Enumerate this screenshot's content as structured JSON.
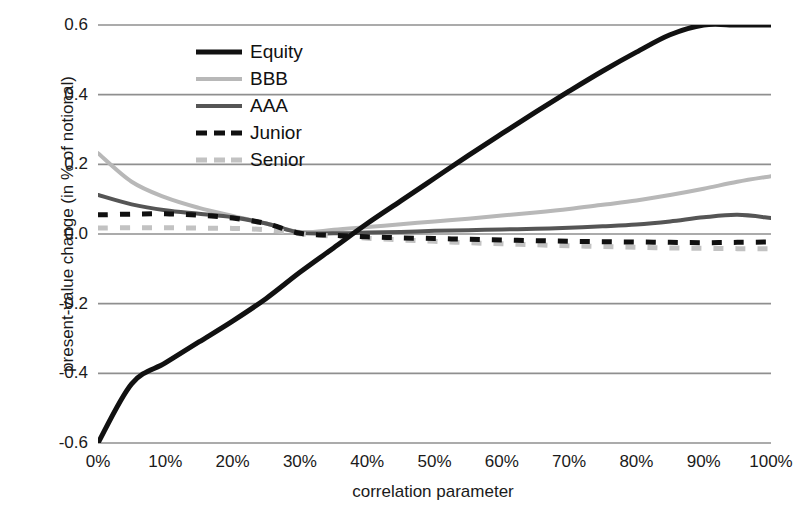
{
  "chart_data": {
    "type": "line",
    "title": "",
    "xlabel": "correlation parameter",
    "ylabel": "present-value change (in % of notional)",
    "xlim": [
      0,
      100
    ],
    "ylim": [
      -0.6,
      0.6
    ],
    "grid": true,
    "legend_position": "upper-left-inside",
    "x_ticklabels": [
      "0%",
      "10%",
      "20%",
      "30%",
      "40%",
      "50%",
      "60%",
      "70%",
      "80%",
      "90%",
      "100%"
    ],
    "x_tickvalues": [
      0,
      10,
      20,
      30,
      40,
      50,
      60,
      70,
      80,
      90,
      100
    ],
    "y_ticklabels": [
      "0.6",
      "0.4",
      "0.2",
      "0.0",
      "-0.2",
      "-0.4",
      "-0.6"
    ],
    "y_tickvalues": [
      0.6,
      0.4,
      0.2,
      0.0,
      -0.2,
      -0.4,
      -0.6
    ],
    "x": [
      0,
      5,
      10,
      15,
      20,
      25,
      30,
      35,
      40,
      45,
      50,
      55,
      60,
      65,
      70,
      75,
      80,
      85,
      90,
      95,
      100
    ],
    "series": [
      {
        "name": "Equity",
        "style": "solid",
        "color": "#111111",
        "width": 5,
        "clipped_above": 0.6,
        "values": [
          -0.6,
          -0.43,
          -0.37,
          -0.31,
          -0.25,
          -0.185,
          -0.11,
          -0.04,
          0.03,
          0.095,
          0.16,
          0.225,
          0.288,
          0.35,
          0.41,
          0.468,
          0.522,
          0.572,
          0.6,
          0.6,
          0.6
        ]
      },
      {
        "name": "BBB",
        "style": "solid",
        "color": "#b8b8b8",
        "width": 4,
        "values": [
          0.232,
          0.15,
          0.105,
          0.075,
          0.052,
          0.03,
          0.006,
          0.012,
          0.02,
          0.028,
          0.036,
          0.044,
          0.053,
          0.062,
          0.072,
          0.084,
          0.096,
          0.112,
          0.13,
          0.15,
          0.166
        ]
      },
      {
        "name": "AAA",
        "style": "solid",
        "color": "#555555",
        "width": 4,
        "values": [
          0.112,
          0.085,
          0.068,
          0.058,
          0.048,
          0.03,
          0.004,
          0.002,
          0.004,
          0.006,
          0.009,
          0.011,
          0.013,
          0.015,
          0.018,
          0.022,
          0.027,
          0.036,
          0.048,
          0.055,
          0.046
        ]
      },
      {
        "name": "Junior",
        "style": "dashed",
        "color": "#101010",
        "width": 5,
        "values": [
          0.055,
          0.057,
          0.058,
          0.054,
          0.046,
          0.03,
          0.002,
          -0.004,
          -0.008,
          -0.011,
          -0.013,
          -0.015,
          -0.017,
          -0.019,
          -0.021,
          -0.022,
          -0.023,
          -0.024,
          -0.025,
          -0.024,
          -0.023
        ]
      },
      {
        "name": "Senior",
        "style": "dashed",
        "color": "#c2c2c2",
        "width": 5,
        "values": [
          0.017,
          0.018,
          0.018,
          0.017,
          0.016,
          0.012,
          0.001,
          -0.006,
          -0.012,
          -0.017,
          -0.021,
          -0.025,
          -0.028,
          -0.031,
          -0.034,
          -0.036,
          -0.038,
          -0.04,
          -0.041,
          -0.042,
          -0.042
        ]
      }
    ]
  },
  "axis": {
    "y_title": "present-value change (in % of notional)",
    "x_title": "correlation parameter"
  },
  "legend": {
    "items": [
      {
        "label": "Equity",
        "swatch": "solid-black-line-icon"
      },
      {
        "label": "BBB",
        "swatch": "solid-lightgray-line-icon"
      },
      {
        "label": "AAA",
        "swatch": "solid-gray-line-icon"
      },
      {
        "label": "Junior",
        "swatch": "dashed-black-line-icon"
      },
      {
        "label": "Senior",
        "swatch": "dashed-lightgray-line-icon"
      }
    ]
  },
  "colors": {
    "equity": "#111111",
    "bbb": "#b8b8b8",
    "aaa": "#555555",
    "junior": "#101010",
    "senior": "#c2c2c2",
    "gridline": "#8f8f8f",
    "text": "#1a1a1a"
  }
}
